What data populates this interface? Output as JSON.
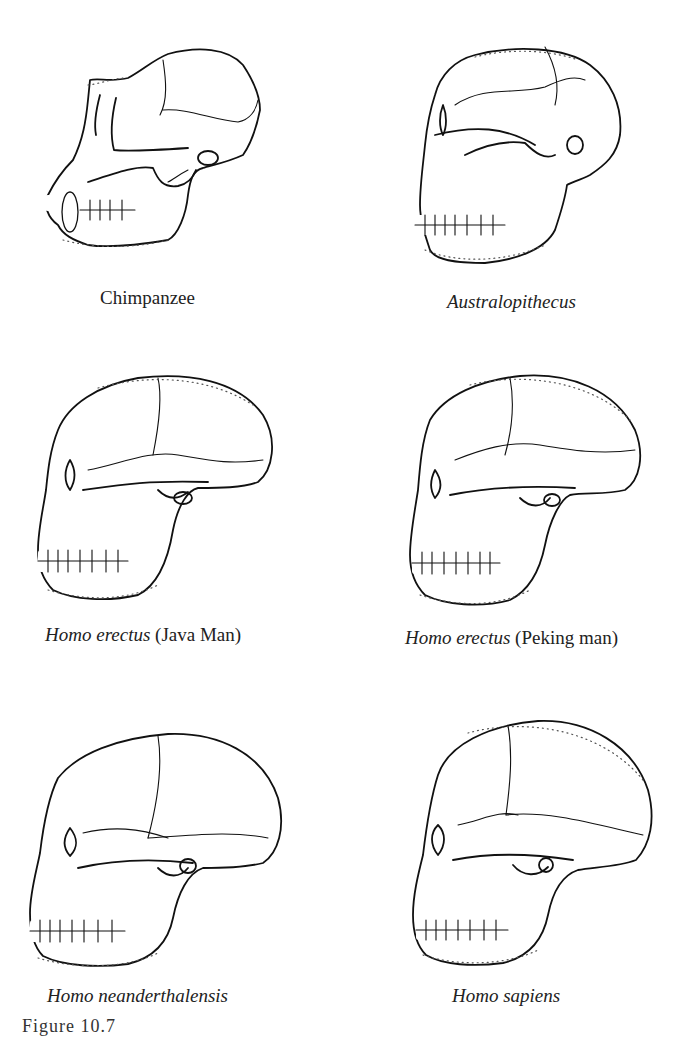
{
  "figure": {
    "label": "Figure 10.7",
    "panels": [
      {
        "id": "chimpanzee",
        "caption_italic": "",
        "caption_plain": "Chimpanzee"
      },
      {
        "id": "australopithecus",
        "caption_italic": "Australopithecus",
        "caption_plain": ""
      },
      {
        "id": "homo-erectus-java",
        "caption_italic": "Homo erectus",
        "caption_plain": " (Java Man)"
      },
      {
        "id": "homo-erectus-peking",
        "caption_italic": "Homo erectus",
        "caption_plain": " (Peking man)"
      },
      {
        "id": "homo-neanderthalensis",
        "caption_italic": "Homo  neanderthalensis",
        "caption_plain": ""
      },
      {
        "id": "homo-sapiens",
        "caption_italic": "Homo sapiens",
        "caption_plain": ""
      }
    ]
  }
}
